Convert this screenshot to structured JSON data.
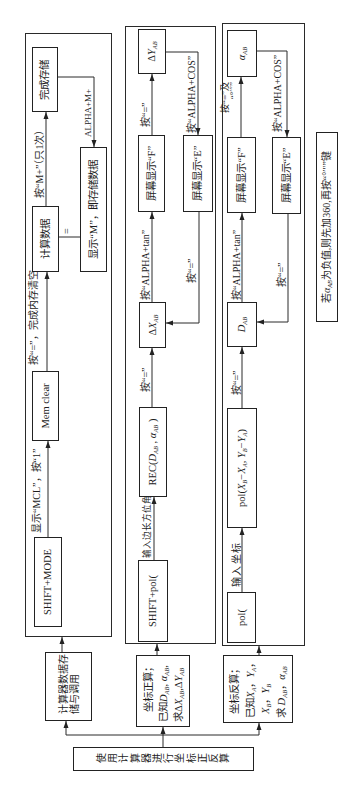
{
  "root": {
    "label": "使用计算器进行坐标正反算"
  },
  "categories": {
    "memory": {
      "lines": [
        "计算器数据存",
        "储与调用"
      ]
    },
    "forward": {
      "title": "坐标正算；",
      "given": [
        {
          "t": "已知"
        },
        {
          "t": "D",
          "sub": "AB"
        },
        {
          "t": ", "
        },
        {
          "t": "α",
          "sub": "AB"
        },
        {
          "t": ","
        }
      ],
      "find": [
        {
          "t": "求"
        },
        {
          "t": "Δ"
        },
        {
          "t": "X",
          "sub": "AB"
        },
        {
          "t": ","
        },
        {
          "t": "Δ"
        },
        {
          "t": "Y",
          "sub": "AB"
        }
      ]
    },
    "inverse": {
      "title": "坐标反算；",
      "given": [
        {
          "t": "已知"
        },
        {
          "t": "X",
          "sub": "A"
        },
        {
          "t": "，"
        },
        {
          "t": "Y",
          "sub": "A"
        },
        {
          "t": "，"
        }
      ],
      "given2": [
        {
          "t": "X",
          "sub": "B"
        },
        {
          "t": "，"
        },
        {
          "t": "Y",
          "sub": "B"
        }
      ],
      "find": [
        {
          "t": "求 "
        },
        {
          "t": "D",
          "sub": "AB"
        },
        {
          "t": "，"
        },
        {
          "t": "α",
          "sub": "AB"
        }
      ]
    }
  },
  "memory_flow": {
    "step1_box": "SHIFT+MODE",
    "step1_label": "显示“MCL”，按“1”",
    "step2_box": "Mem clear",
    "step2_label": "按“=”，完成内存清空",
    "step3_box": "计算数据",
    "equals_label": "=",
    "display_box": "显示“M”，即存储数据",
    "step4_label": "按“M+”（只1次）",
    "step4_box": "完成存储",
    "recall_label": "ALPHA+M+"
  },
  "forward_flow": {
    "step1_box": "SHIFT+pol(",
    "step1_label": "输入边长方位角",
    "rec_box": [
      {
        "t": "REC("
      },
      {
        "t": "D",
        "sub": "AB"
      },
      {
        "t": " , "
      },
      {
        "t": "α",
        "sub": "AB"
      },
      {
        "t": " )"
      }
    ],
    "step2_label": "按“=”",
    "dx_box": [
      {
        "t": "Δ"
      },
      {
        "t": "X",
        "sub": "AB"
      }
    ],
    "step3_label": "按“ALPHA+tan”",
    "f_box": "屏幕显示“F”",
    "step4_label": "按“=”",
    "dy_box": [
      {
        "t": "Δ"
      },
      {
        "t": "Y",
        "sub": "AB"
      }
    ],
    "step5_label": "按“ALPHA+COS”",
    "e_box": "屏幕显示“E”",
    "step6_label": "按“=”"
  },
  "inverse_flow": {
    "step1_box": "pol(",
    "step1_label": "输入坐标",
    "pol_box": [
      {
        "t": "pol("
      },
      {
        "t": "X",
        "sub": "B"
      },
      {
        "t": "−"
      },
      {
        "t": "X",
        "sub": "A"
      },
      {
        "t": ", "
      },
      {
        "t": "Y",
        "sub": "B"
      },
      {
        "t": "−"
      },
      {
        "t": "Y",
        "sub": "A"
      },
      {
        "t": ")"
      }
    ],
    "step2_label": "按“=”",
    "d_box": [
      {
        "t": "D",
        "sub": "AB"
      }
    ],
    "step3_label": "按“ALPHA+tan”",
    "f_box": "屏幕显示“F”",
    "step4_label_line1": "按“=”及",
    "step4_label_line2": "“°′″”",
    "alpha_box": [
      {
        "t": "α",
        "sub": "AB"
      }
    ],
    "step5_label": "按“ALPHA+COS”",
    "e_box": "屏幕显示“E”",
    "step6_label": "按“=”"
  },
  "note": [
    {
      "t": "若"
    },
    {
      "t": "α",
      "sub": "AB"
    },
    {
      "t": "为负值,则先加360,再按“°′″”键"
    }
  ]
}
